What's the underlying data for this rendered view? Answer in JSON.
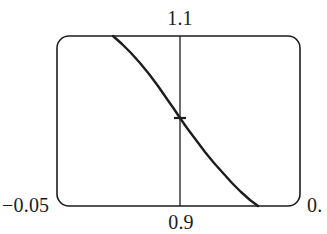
{
  "figure": {
    "background_color": "#ffffff",
    "stroke_color": "#1c1c1c"
  },
  "labels": {
    "top": "1.1",
    "bottom": "0.9",
    "left": "−0.05",
    "right": "0."
  },
  "chart_data": {
    "type": "line",
    "title": "",
    "xlabel": "",
    "ylabel": "",
    "grid": false,
    "legend": false,
    "frame": {
      "shape": "rounded-rectangle",
      "x_left_px": 57,
      "x_right_px": 300,
      "y_top_px": 36,
      "y_bottom_px": 206,
      "corner_radius_px": 12,
      "stroke_width_px": 1.6
    },
    "axis_ranges": {
      "x_tick_labels": [
        "0.9"
      ],
      "x_tick_positions_px": [
        180
      ],
      "y_tick_labels": [
        "1.1",
        "−0.05"
      ],
      "y_top_label": "1.1",
      "y_bottom_left_label": "−0.05",
      "y_bottom_right_label": "0."
    },
    "annotations": [
      {
        "name": "vertical-reference-line",
        "type": "vline",
        "x_px": 180,
        "y_start_px": 36,
        "y_end_px": 206,
        "label_top": "1.1",
        "label_bottom": "0.9"
      },
      {
        "name": "crossing-tick",
        "type": "tick",
        "x_px": 180,
        "y_px": 118,
        "half_width_px": 6,
        "orientation": "horizontal"
      }
    ],
    "series": [
      {
        "name": "curve",
        "style": "solid",
        "color": "#1c1c1c",
        "width_px": 2.4,
        "points_px": [
          [
            113,
            36
          ],
          [
            122,
            44
          ],
          [
            131,
            53
          ],
          [
            140,
            63
          ],
          [
            149,
            74
          ],
          [
            158,
            86
          ],
          [
            167,
            99
          ],
          [
            174,
            109
          ],
          [
            180,
            118
          ],
          [
            187,
            128
          ],
          [
            196,
            140
          ],
          [
            205,
            152
          ],
          [
            214,
            163
          ],
          [
            223,
            173
          ],
          [
            232,
            183
          ],
          [
            241,
            192
          ],
          [
            250,
            200
          ],
          [
            258,
            206
          ]
        ]
      }
    ]
  }
}
